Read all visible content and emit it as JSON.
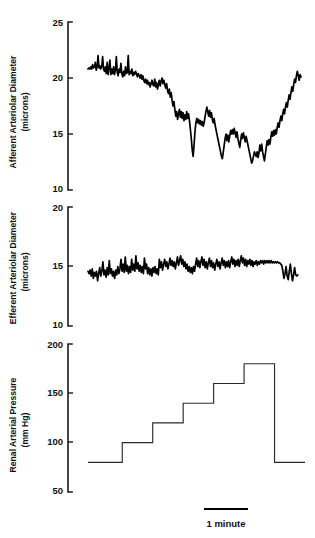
{
  "figure": {
    "background_color": "#ffffff",
    "ink_color": "#000000",
    "scale_bar": {
      "label": "1 minute",
      "name": "time-scale-bar"
    }
  },
  "chart_data": [
    {
      "type": "line",
      "name": "afferent-arteriolar-diameter",
      "title": "",
      "ylabel": "Afferent Arteriolar Diameter",
      "yunits": "(microns)",
      "xlabel": "",
      "ylim": [
        10,
        25
      ],
      "yticks": [
        10,
        15,
        20,
        25
      ],
      "ytick_labels": [
        "10",
        "15",
        "20",
        "25"
      ],
      "grid": false,
      "legend": "none",
      "x": [
        0.0,
        0.6,
        1.2,
        1.8,
        2.4,
        3.0,
        3.6,
        4.2,
        4.8,
        5.4,
        6.0,
        6.6,
        7.2,
        7.8,
        8.4,
        9.0,
        9.6,
        10.2,
        10.8,
        11.4,
        12.0,
        12.6,
        13.2,
        13.8,
        14.4,
        15.0,
        15.6,
        16.2,
        16.8,
        17.4,
        18.0,
        18.6,
        19.2,
        19.8,
        20.4,
        21.0,
        21.6,
        22.2,
        22.8,
        23.4,
        24.0,
        24.6,
        25.2,
        25.8,
        26.4,
        27.0,
        27.6,
        28.2,
        28.8,
        29.4,
        30.0,
        30.6,
        31.2,
        31.8,
        32.4,
        33.0,
        33.6,
        34.2,
        34.8,
        35.4,
        36.0,
        36.6,
        37.2,
        37.8,
        38.4,
        39.0,
        39.6,
        40.2,
        40.8,
        41.4,
        42.0,
        42.6,
        43.2,
        43.8,
        44.4,
        45.0,
        45.6,
        46.2,
        46.8,
        47.4,
        48.0,
        48.6,
        49.2,
        49.8,
        50.4,
        51.0,
        51.6,
        52.2,
        52.8,
        53.4,
        54.0,
        54.6,
        55.2,
        55.8,
        56.4,
        57.0,
        57.6,
        58.2,
        58.8,
        59.4,
        60.0,
        60.6,
        61.2,
        61.8,
        62.4,
        63.0,
        63.6,
        64.2,
        64.8,
        65.4,
        66.0,
        66.6,
        67.2,
        67.8,
        68.4,
        69.0,
        69.6,
        70.2,
        70.8,
        71.4,
        72.0,
        72.6,
        73.2,
        73.8,
        74.4,
        75.0,
        75.6,
        76.2,
        76.8,
        77.4,
        78.0,
        78.6,
        79.2,
        79.8,
        80.4,
        81.0,
        81.6,
        82.2,
        82.8,
        83.4,
        84.0,
        84.6,
        85.2,
        85.8,
        86.4,
        87.0,
        87.6,
        88.2,
        88.8,
        89.4,
        90.0,
        90.6,
        91.2,
        91.8,
        92.4,
        93.0,
        93.6,
        94.2,
        94.8,
        95.4,
        96.0,
        96.6,
        97.2,
        97.8,
        98.4,
        99.0,
        99.6,
        100.2,
        100.8,
        101.4,
        102.0,
        102.6,
        103.2,
        103.8,
        104.4,
        105.0,
        105.6,
        106.2,
        106.8,
        107.4,
        108.0,
        108.6,
        109.2,
        109.8,
        110.4,
        111.0,
        111.6,
        112.2,
        112.8,
        113.4,
        114.0,
        114.6,
        115.2,
        115.8,
        116.4,
        117.0,
        117.6,
        118.2,
        118.8,
        119.4,
        120.0,
        120.6,
        121.2,
        121.8,
        122.4,
        123.0,
        123.6,
        124.2,
        124.8,
        125.4,
        126.0,
        126.6,
        127.2,
        127.8,
        128.4,
        129.0,
        129.6,
        130.2,
        130.8,
        131.4,
        132.0,
        132.6,
        133.2,
        133.8,
        134.4,
        135.0,
        135.6,
        136.2,
        136.8,
        137.4,
        138.0,
        138.6,
        139.2,
        139.8
      ],
      "y": [
        20.8,
        20.9,
        20.8,
        21.0,
        20.8,
        21.2,
        20.9,
        21.0,
        21.4,
        20.7,
        21.0,
        22.0,
        20.9,
        21.1,
        20.8,
        21.0,
        21.9,
        20.8,
        20.6,
        21.0,
        20.4,
        21.4,
        20.3,
        20.9,
        21.6,
        20.3,
        20.8,
        20.4,
        21.0,
        20.3,
        20.7,
        21.9,
        20.5,
        20.2,
        20.8,
        20.5,
        21.3,
        20.4,
        20.1,
        20.6,
        20.2,
        21.0,
        20.4,
        20.5,
        22.0,
        20.3,
        20.6,
        20.4,
        20.8,
        20.2,
        20.5,
        20.3,
        20.6,
        20.4,
        20.1,
        20.4,
        20.2,
        20.0,
        20.3,
        19.9,
        20.2,
        19.8,
        19.6,
        19.9,
        19.5,
        19.8,
        19.4,
        19.6,
        19.2,
        19.5,
        19.8,
        19.4,
        19.3,
        19.9,
        19.2,
        19.6,
        19.0,
        19.4,
        19.8,
        19.3,
        19.7,
        20.0,
        19.5,
        19.8,
        19.4,
        19.1,
        19.5,
        18.9,
        18.6,
        19.0,
        18.3,
        18.7,
        18.0,
        17.5,
        17.9,
        17.2,
        16.6,
        17.0,
        16.3,
        16.8,
        17.2,
        16.5,
        17.0,
        16.4,
        16.9,
        16.2,
        16.7,
        16.3,
        17.0,
        16.4,
        16.8,
        16.2,
        15.4,
        14.6,
        13.6,
        13.0,
        14.0,
        15.2,
        16.0,
        16.4,
        16.0,
        16.3,
        15.9,
        16.2,
        15.8,
        16.1,
        15.7,
        16.0,
        16.5,
        17.0,
        17.4,
        17.0,
        16.6,
        17.1,
        16.5,
        16.9,
        16.3,
        16.0,
        16.4,
        15.8,
        15.4,
        15.0,
        14.6,
        14.2,
        13.8,
        13.4,
        13.0,
        12.8,
        13.4,
        14.0,
        14.6,
        15.0,
        14.4,
        14.9,
        14.3,
        14.8,
        15.3,
        15.0,
        15.4,
        15.0,
        15.5,
        15.1,
        14.7,
        15.2,
        14.6,
        14.2,
        13.8,
        14.4,
        15.0,
        14.6,
        15.1,
        14.7,
        14.3,
        14.8,
        14.4,
        14.0,
        13.6,
        13.2,
        12.8,
        12.4,
        12.6,
        13.0,
        13.4,
        13.2,
        13.0,
        13.4,
        12.9,
        13.3,
        14.0,
        13.5,
        14.1,
        13.4,
        13.0,
        12.6,
        13.2,
        13.8,
        14.4,
        14.0,
        14.5,
        14.1,
        14.7,
        15.2,
        14.8,
        15.3,
        14.9,
        15.4,
        15.0,
        15.6,
        16.0,
        15.6,
        16.2,
        16.6,
        16.2,
        16.8,
        17.2,
        16.8,
        17.4,
        17.8,
        17.4,
        18.0,
        18.5,
        18.1,
        18.7,
        19.2,
        18.8,
        19.4,
        19.9,
        19.6,
        20.2,
        20.6,
        20.2,
        19.8,
        20.3,
        20.1,
        20.5,
        20.3,
        20.7
      ]
    },
    {
      "type": "line",
      "name": "efferent-arteriolar-diameter",
      "title": "",
      "ylabel": "Efferent Arteriolar Diameter",
      "yunits": "(microns)",
      "xlabel": "",
      "ylim": [
        10,
        20
      ],
      "yticks": [
        10,
        15,
        20
      ],
      "ytick_labels": [
        "10",
        "15",
        "20"
      ],
      "grid": false,
      "legend": "none",
      "x": [
        0.0,
        0.7,
        1.4,
        2.1,
        2.8,
        3.5,
        4.2,
        4.9,
        5.6,
        6.3,
        7.0,
        7.7,
        8.4,
        9.1,
        9.8,
        10.5,
        11.2,
        11.9,
        12.6,
        13.3,
        14.0,
        14.7,
        15.4,
        16.1,
        16.8,
        17.5,
        18.2,
        18.9,
        19.6,
        20.3,
        21.0,
        21.7,
        22.4,
        23.1,
        23.8,
        24.5,
        25.2,
        25.9,
        26.6,
        27.3,
        28.0,
        28.7,
        29.4,
        30.1,
        30.8,
        31.5,
        32.2,
        32.9,
        33.6,
        34.3,
        35.0,
        35.7,
        36.4,
        37.1,
        37.8,
        38.5,
        39.2,
        39.9,
        40.6,
        41.3,
        42.0,
        42.7,
        43.4,
        44.1,
        44.8,
        45.5,
        46.2,
        46.9,
        47.6,
        48.3,
        49.0,
        49.7,
        50.4,
        51.1,
        51.8,
        52.5,
        53.2,
        53.9,
        54.6,
        55.3,
        56.0,
        56.7,
        57.4,
        58.1,
        58.8,
        59.5,
        60.2,
        60.9,
        61.6,
        62.3,
        63.0,
        63.7,
        64.4,
        65.1,
        65.8,
        66.5,
        67.2,
        67.9,
        68.6,
        69.3,
        70.0,
        70.7,
        71.4,
        72.1,
        72.8,
        73.5,
        74.2,
        74.9,
        75.6,
        76.3,
        77.0,
        77.7,
        78.4,
        79.1,
        79.8,
        80.5,
        81.2,
        81.9,
        82.6,
        83.3,
        84.0,
        84.7,
        85.4,
        86.1,
        86.8,
        87.5,
        88.2,
        88.9,
        89.6,
        90.3,
        91.0,
        91.7,
        92.4,
        93.1,
        93.8,
        94.5,
        95.2,
        95.9,
        96.6,
        97.3,
        98.0,
        98.7,
        99.4,
        100.1,
        100.8,
        101.5,
        102.2,
        102.9,
        103.6,
        104.3,
        105.0,
        105.7,
        106.4,
        107.1,
        107.8,
        108.5,
        109.2,
        109.9,
        110.6,
        111.3,
        112.0,
        112.7,
        113.4,
        114.1,
        114.8,
        115.5,
        116.2,
        116.9,
        117.6,
        118.3,
        119.0,
        119.7,
        120.4,
        121.1,
        121.8,
        122.5,
        123.2,
        123.9,
        124.6,
        125.3,
        126.0,
        126.7,
        127.4,
        128.1,
        128.8,
        129.5,
        130.2,
        130.9,
        131.6,
        132.3,
        133.0,
        133.7,
        134.4,
        135.1,
        135.8,
        136.5,
        137.2,
        137.9,
        138.6,
        139.3,
        140.0
      ],
      "y": [
        14.6,
        14.4,
        14.7,
        14.2,
        14.8,
        14.0,
        14.5,
        14.2,
        14.6,
        13.8,
        14.4,
        14.9,
        14.2,
        14.6,
        15.4,
        14.3,
        14.7,
        14.1,
        14.9,
        14.3,
        15.5,
        14.4,
        14.8,
        14.2,
        14.6,
        14.0,
        14.7,
        14.3,
        15.0,
        14.4,
        14.8,
        15.6,
        14.6,
        15.2,
        14.5,
        15.8,
        14.6,
        15.1,
        14.4,
        15.0,
        14.5,
        15.6,
        14.7,
        15.2,
        14.6,
        15.9,
        14.8,
        15.3,
        14.6,
        15.1,
        14.5,
        15.0,
        14.4,
        15.7,
        14.8,
        15.2,
        14.4,
        14.9,
        14.3,
        14.8,
        14.2,
        14.9,
        14.5,
        15.0,
        14.4,
        14.8,
        14.3,
        15.6,
        14.9,
        15.4,
        14.7,
        15.2,
        15.6,
        15.0,
        15.4,
        14.8,
        15.2,
        15.7,
        15.1,
        15.5,
        15.0,
        15.4,
        14.8,
        15.3,
        15.8,
        15.1,
        15.5,
        15.9,
        15.2,
        15.6,
        15.0,
        15.4,
        14.8,
        15.2,
        14.6,
        15.0,
        14.5,
        14.9,
        14.4,
        15.0,
        14.6,
        15.2,
        15.7,
        15.0,
        15.5,
        14.9,
        15.4,
        15.8,
        15.1,
        15.6,
        14.9,
        15.4,
        14.8,
        15.3,
        15.7,
        15.0,
        15.5,
        14.9,
        15.3,
        14.7,
        15.2,
        15.6,
        15.0,
        15.4,
        14.8,
        15.3,
        15.7,
        15.1,
        15.5,
        14.9,
        15.4,
        15.0,
        15.5,
        14.9,
        15.4,
        15.8,
        15.2,
        15.6,
        15.0,
        15.5,
        15.1,
        15.6,
        15.0,
        15.5,
        15.9,
        15.3,
        15.7,
        15.1,
        15.6,
        15.0,
        15.5,
        15.2,
        15.6,
        15.1,
        15.5,
        15.0,
        15.4,
        15.2,
        15.5,
        15.1,
        15.4,
        15.2,
        15.5,
        15.3,
        15.5,
        15.2,
        15.5,
        15.3,
        15.5,
        15.3,
        15.5,
        15.3,
        15.5,
        15.3,
        15.4,
        15.3,
        15.4,
        15.3,
        15.4,
        15.3,
        15.3,
        15.2,
        15.1,
        14.6,
        14.0,
        14.4,
        15.0,
        14.2,
        13.9,
        14.6,
        15.2,
        14.4,
        13.8,
        14.3,
        14.9,
        14.3,
        14.2,
        14.3
      ]
    },
    {
      "type": "line",
      "name": "renal-arterial-pressure",
      "title": "",
      "ylabel": "Renal Arterial Pressure",
      "yunits": "(mm Hg)",
      "xlabel": "",
      "ylim": [
        50,
        200
      ],
      "yticks": [
        50,
        100,
        150,
        200
      ],
      "ytick_labels": [
        "50",
        "100",
        "150",
        "200"
      ],
      "grid": false,
      "legend": "none",
      "step_levels_mmhg": [
        80,
        100,
        120,
        140,
        160,
        180,
        80
      ],
      "x": [
        0.0,
        18.0,
        18.0,
        34.0,
        34.0,
        50.0,
        50.0,
        66.0,
        66.0,
        82.0,
        82.0,
        98.0,
        98.0,
        114.0
      ],
      "y": [
        80,
        80,
        100,
        100,
        120,
        120,
        140,
        140,
        160,
        160,
        180,
        180,
        80,
        80
      ]
    }
  ]
}
